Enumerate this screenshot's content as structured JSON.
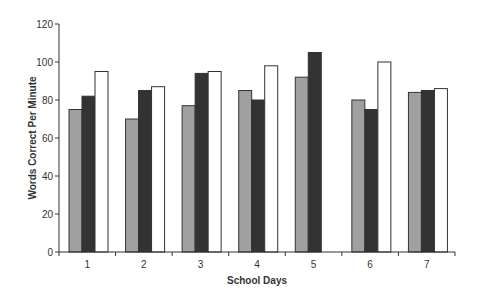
{
  "chart_data": {
    "type": "bar",
    "title": "",
    "xlabel": "School Days",
    "ylabel": "Words Correct Per Minute",
    "categories": [
      "1",
      "2",
      "3",
      "4",
      "5",
      "6",
      "7"
    ],
    "series": [
      {
        "name": "Series 1",
        "color": "#a0a0a0",
        "values": [
          75,
          70,
          77,
          85,
          92,
          80,
          84
        ]
      },
      {
        "name": "Series 2",
        "color": "#333333",
        "values": [
          82,
          85,
          94,
          80,
          105,
          75,
          85
        ]
      },
      {
        "name": "Series 3",
        "color": "#ffffff",
        "values": [
          95,
          87,
          95,
          98,
          null,
          100,
          86
        ]
      }
    ],
    "ylim": [
      0,
      120
    ],
    "yticks": [
      0,
      20,
      40,
      60,
      80,
      100,
      120
    ],
    "grid": false,
    "legend": "none"
  },
  "layout": {
    "plot_left": 59,
    "plot_right": 455,
    "plot_top": 24,
    "plot_bottom": 252,
    "bar_width": 13,
    "group_offset": 10,
    "bar_stroke": "#333333",
    "axis_color": "#333333"
  }
}
